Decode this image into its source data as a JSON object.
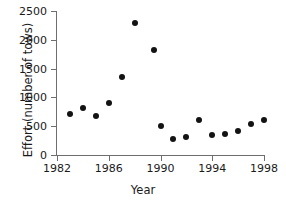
{
  "chart_data": {
    "type": "scatter",
    "title": "",
    "xlabel": "Year",
    "ylabel": "Effort (number of tows)",
    "xlim": [
      1982,
      1998
    ],
    "ylim": [
      0,
      2500
    ],
    "xticks": [
      1982,
      1986,
      1990,
      1994,
      1998
    ],
    "yticks": [
      0,
      500,
      1000,
      1500,
      2000,
      2500
    ],
    "xtick_labels": [
      "1982",
      "1986",
      "1990",
      "1994",
      "1998"
    ],
    "ytick_labels": [
      "0",
      "500",
      "1000",
      "1500",
      "2000",
      "2500"
    ],
    "grid": false,
    "legend": "none",
    "marker": "filled-circle",
    "marker_color": "#131313",
    "axis_color": "#6e6e6e",
    "x": [
      1983,
      1984,
      1985,
      1986,
      1987,
      1988,
      1989.5,
      1990,
      1991,
      1992,
      1993,
      1994,
      1995,
      1996,
      1997,
      1998
    ],
    "y": [
      720,
      810,
      670,
      900,
      1360,
      2300,
      1830,
      500,
      270,
      320,
      600,
      350,
      370,
      420,
      540,
      610
    ],
    "points": [
      {
        "x": 1983,
        "y": 720
      },
      {
        "x": 1984,
        "y": 810
      },
      {
        "x": 1985,
        "y": 670
      },
      {
        "x": 1986,
        "y": 900
      },
      {
        "x": 1987,
        "y": 1360
      },
      {
        "x": 1988,
        "y": 2300
      },
      {
        "x": 1989.5,
        "y": 1830
      },
      {
        "x": 1990,
        "y": 500
      },
      {
        "x": 1991,
        "y": 270
      },
      {
        "x": 1992,
        "y": 320
      },
      {
        "x": 1993,
        "y": 600
      },
      {
        "x": 1994,
        "y": 350
      },
      {
        "x": 1995,
        "y": 370
      },
      {
        "x": 1996,
        "y": 420
      },
      {
        "x": 1997,
        "y": 540
      },
      {
        "x": 1998,
        "y": 610
      }
    ]
  }
}
